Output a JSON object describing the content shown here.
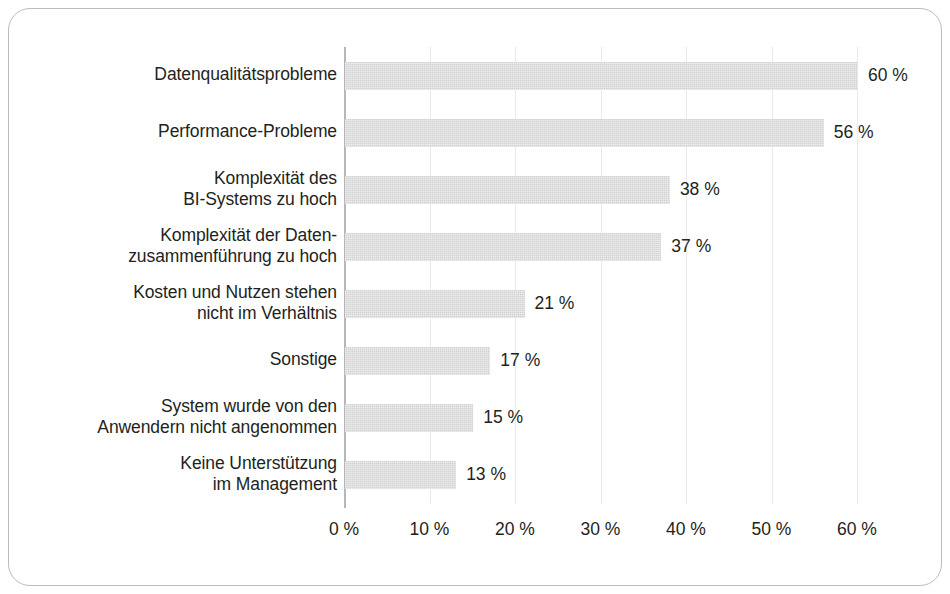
{
  "chart_data": {
    "type": "bar",
    "orientation": "horizontal",
    "title": "",
    "subtitle": "",
    "xlabel": "",
    "ylabel": "",
    "xlim": [
      0,
      60
    ],
    "grid": true,
    "legend": null,
    "legend_position": "none",
    "bar_color": "#d2d2d2",
    "text_color": "#231f20",
    "gridline_color": "#e9eaec",
    "axis_color": "#b5b7ba",
    "frame_color": "#b9bcc0",
    "background_color": "#ffffff",
    "categories": [
      "Datenqualitätsprobleme",
      "Performance-Probleme",
      "Komplexität des\nBI-Systems zu hoch",
      "Komplexität der Daten-\nzusammenführung zu hoch",
      "Kosten und Nutzen stehen\nnicht im Verhältnis",
      "Sonstige",
      "System wurde von den\nAnwendern nicht angenommen",
      "Keine Unterstützung\nim Management"
    ],
    "values": [
      60,
      56,
      38,
      37,
      21,
      17,
      15,
      13
    ],
    "value_labels": [
      "60 %",
      "56 %",
      "38 %",
      "37 %",
      "21 %",
      "17 %",
      "15 %",
      "13 %"
    ],
    "xticks": [
      0,
      10,
      20,
      30,
      40,
      50,
      60
    ],
    "xtick_labels": [
      "0 %",
      "10 %",
      "20 %",
      "30 %",
      "40 %",
      "50 %",
      "60 %"
    ]
  }
}
